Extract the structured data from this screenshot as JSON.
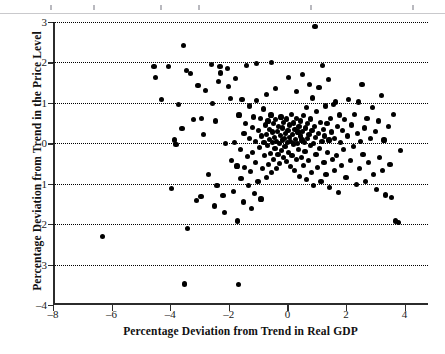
{
  "chart_data": {
    "type": "scatter",
    "title": "",
    "xlabel": "Percentage Deviation from Trend in Real GDP",
    "ylabel": "Percentage Deviation from Trend in the Price Level",
    "xlim": [
      -8,
      4.8
    ],
    "ylim": [
      -4,
      3
    ],
    "xticks": [
      -8,
      -6,
      -4,
      -2,
      0,
      2,
      4
    ],
    "xticklabels": [
      "–8",
      "–6",
      "–4",
      "–2",
      "0",
      "2",
      "4"
    ],
    "yticks": [
      -4,
      -3,
      -2,
      -1,
      0,
      1,
      2,
      3
    ],
    "yticklabels": [
      "–4",
      "–3",
      "–2",
      "–1",
      "0",
      "1",
      "2",
      "3"
    ],
    "gridlines_y": [
      -3,
      -2,
      -1,
      0,
      1,
      2,
      3
    ],
    "grid": "horizontal-dotted",
    "legend": "none",
    "marker": "filled-circle",
    "marker_color": "#000000",
    "n_points": 232,
    "points": [
      [
        -6.3,
        -2.3
      ],
      [
        -4.55,
        1.9
      ],
      [
        -4.5,
        1.63
      ],
      [
        -4.3,
        1.08
      ],
      [
        -4.05,
        1.9
      ],
      [
        -3.95,
        -1.12
      ],
      [
        -3.85,
        0.08
      ],
      [
        -3.8,
        -0.03
      ],
      [
        -3.6,
        0.37
      ],
      [
        -3.55,
        2.42
      ],
      [
        -3.5,
        -3.48
      ],
      [
        -3.45,
        1.8
      ],
      [
        -3.4,
        -2.1
      ],
      [
        -3.3,
        1.72
      ],
      [
        -3.2,
        0.58
      ],
      [
        -3.1,
        -1.42
      ],
      [
        -3.05,
        1.42
      ],
      [
        -2.95,
        -1.32
      ],
      [
        -2.85,
        0.22
      ],
      [
        -2.8,
        1.3
      ],
      [
        -2.7,
        -0.78
      ],
      [
        -2.6,
        1.95
      ],
      [
        -2.55,
        0.98
      ],
      [
        -2.5,
        -1.55
      ],
      [
        -2.45,
        0.55
      ],
      [
        -2.4,
        -1.05
      ],
      [
        -2.35,
        1.52
      ],
      [
        -2.3,
        1.9
      ],
      [
        -2.28,
        1.74
      ],
      [
        -2.2,
        -1.3
      ],
      [
        -2.15,
        -1.72
      ],
      [
        -2.1,
        0.0
      ],
      [
        -2.05,
        1.85
      ],
      [
        -2.0,
        1.4
      ],
      [
        -1.95,
        1.1
      ],
      [
        -1.9,
        -0.42
      ],
      [
        -1.85,
        -1.2
      ],
      [
        -1.8,
        0.02
      ],
      [
        -1.78,
        1.6
      ],
      [
        -1.72,
        -0.56
      ],
      [
        -1.7,
        -1.92
      ],
      [
        -1.68,
        -3.5
      ],
      [
        -1.65,
        0.7
      ],
      [
        -1.6,
        -0.15
      ],
      [
        -1.58,
        -0.88
      ],
      [
        -1.55,
        1.08
      ],
      [
        -1.5,
        -1.45
      ],
      [
        -1.48,
        0.25
      ],
      [
        -1.45,
        -0.6
      ],
      [
        -1.42,
        0.48
      ],
      [
        -1.4,
        1.92
      ],
      [
        -1.35,
        -0.32
      ],
      [
        -1.32,
        -1.05
      ],
      [
        -1.3,
        0.12
      ],
      [
        -1.28,
        0.92
      ],
      [
        -1.25,
        -0.7
      ],
      [
        -1.22,
        -1.62
      ],
      [
        -1.2,
        0.4
      ],
      [
        -1.18,
        -0.22
      ],
      [
        -1.15,
        0.65
      ],
      [
        -1.12,
        -1.25
      ],
      [
        -1.1,
        0.05
      ],
      [
        -1.08,
        -0.48
      ],
      [
        -1.05,
        1.05
      ],
      [
        -1.0,
        -0.95
      ],
      [
        -0.98,
        0.32
      ],
      [
        -0.95,
        -0.1
      ],
      [
        -0.92,
        0.62
      ],
      [
        -0.9,
        -1.38
      ],
      [
        -0.88,
        0.18
      ],
      [
        -0.85,
        -0.62
      ],
      [
        -0.82,
        0.85
      ],
      [
        -0.8,
        0.02
      ],
      [
        -0.78,
        -0.3
      ],
      [
        -0.75,
        0.45
      ],
      [
        -0.72,
        -0.85
      ],
      [
        -0.7,
        0.22
      ],
      [
        -0.68,
        -0.05
      ],
      [
        -0.66,
        0.55
      ],
      [
        -0.64,
        -0.52
      ],
      [
        -0.62,
        0.1
      ],
      [
        -0.6,
        0.35
      ],
      [
        -0.58,
        -0.25
      ],
      [
        -0.56,
        0.7
      ],
      [
        -0.54,
        -0.72
      ],
      [
        -0.52,
        0.02
      ],
      [
        -0.5,
        0.28
      ],
      [
        -0.48,
        -0.4
      ],
      [
        -0.46,
        0.48
      ],
      [
        -0.44,
        0.15
      ],
      [
        -0.42,
        -0.12
      ],
      [
        -0.4,
        0.58
      ],
      [
        -0.38,
        -0.62
      ],
      [
        -0.36,
        0.05
      ],
      [
        -0.34,
        0.3
      ],
      [
        -0.32,
        -0.28
      ],
      [
        -0.3,
        0.42
      ],
      [
        -0.28,
        0.0
      ],
      [
        -0.26,
        -0.5
      ],
      [
        -0.24,
        0.2
      ],
      [
        -0.22,
        0.65
      ],
      [
        -0.2,
        -0.18
      ],
      [
        -0.18,
        0.08
      ],
      [
        -0.16,
        0.38
      ],
      [
        -0.14,
        -0.35
      ],
      [
        -0.12,
        0.52
      ],
      [
        -0.1,
        0.12
      ],
      [
        -0.08,
        -0.08
      ],
      [
        -0.06,
        0.25
      ],
      [
        -0.04,
        -0.45
      ],
      [
        -0.02,
        0.6
      ],
      [
        0.0,
        0.02
      ],
      [
        0.02,
        0.32
      ],
      [
        0.04,
        -0.22
      ],
      [
        0.06,
        0.45
      ],
      [
        0.08,
        0.15
      ],
      [
        0.1,
        -0.58
      ],
      [
        0.12,
        0.05
      ],
      [
        0.14,
        0.72
      ],
      [
        0.16,
        -0.3
      ],
      [
        0.18,
        0.22
      ],
      [
        0.2,
        0.5
      ],
      [
        0.22,
        -0.02
      ],
      [
        0.24,
        -0.68
      ],
      [
        0.26,
        0.35
      ],
      [
        0.28,
        0.1
      ],
      [
        0.3,
        -0.4
      ],
      [
        0.32,
        0.62
      ],
      [
        0.34,
        0.0
      ],
      [
        0.36,
        0.28
      ],
      [
        0.38,
        -0.15
      ],
      [
        0.4,
        0.42
      ],
      [
        0.42,
        -0.82
      ],
      [
        0.44,
        0.18
      ],
      [
        0.46,
        0.55
      ],
      [
        0.48,
        -0.35
      ],
      [
        0.5,
        0.08
      ],
      [
        0.52,
        0.3
      ],
      [
        0.54,
        -0.55
      ],
      [
        0.56,
        0.68
      ],
      [
        0.58,
        0.02
      ],
      [
        0.6,
        -0.2
      ],
      [
        0.62,
        0.38
      ],
      [
        0.64,
        0.88
      ],
      [
        0.66,
        -0.9
      ],
      [
        0.68,
        0.12
      ],
      [
        0.7,
        0.48
      ],
      [
        0.72,
        -0.42
      ],
      [
        0.74,
        0.22
      ],
      [
        0.76,
        1.45
      ],
      [
        0.78,
        -0.05
      ],
      [
        0.8,
        0.6
      ],
      [
        0.82,
        -0.72
      ],
      [
        0.84,
        0.32
      ],
      [
        0.86,
        1.12
      ],
      [
        0.88,
        0.0
      ],
      [
        0.9,
        -1.05
      ],
      [
        0.92,
        0.42
      ],
      [
        0.94,
        2.88
      ],
      [
        0.96,
        0.15
      ],
      [
        0.98,
        -0.28
      ],
      [
        1.0,
        0.78
      ],
      [
        1.02,
        -0.6
      ],
      [
        1.05,
        0.25
      ],
      [
        1.08,
        1.38
      ],
      [
        1.1,
        -0.12
      ],
      [
        1.12,
        0.52
      ],
      [
        1.15,
        -0.95
      ],
      [
        1.18,
        0.05
      ],
      [
        1.2,
        1.92
      ],
      [
        1.22,
        0.35
      ],
      [
        1.25,
        -0.48
      ],
      [
        1.28,
        0.18
      ],
      [
        1.3,
        0.92
      ],
      [
        1.32,
        -0.78
      ],
      [
        1.35,
        0.48
      ],
      [
        1.38,
        -0.22
      ],
      [
        1.4,
        1.58
      ],
      [
        1.42,
        0.08
      ],
      [
        1.45,
        -1.1
      ],
      [
        1.48,
        0.62
      ],
      [
        1.5,
        0.28
      ],
      [
        1.55,
        -0.4
      ],
      [
        1.58,
        0.95
      ],
      [
        1.6,
        -0.68
      ],
      [
        1.62,
        0.12
      ],
      [
        1.65,
        1.02
      ],
      [
        1.68,
        -0.3
      ],
      [
        1.7,
        0.42
      ],
      [
        1.75,
        -1.22
      ],
      [
        1.78,
        0.7
      ],
      [
        1.8,
        0.02
      ],
      [
        1.85,
        -0.55
      ],
      [
        1.88,
        0.32
      ],
      [
        1.92,
        -0.15
      ],
      [
        1.95,
        0.58
      ],
      [
        2.0,
        -0.85
      ],
      [
        2.05,
        0.18
      ],
      [
        2.1,
        1.08
      ],
      [
        2.15,
        -0.42
      ],
      [
        2.2,
        0.45
      ],
      [
        2.25,
        -0.08
      ],
      [
        2.3,
        0.72
      ],
      [
        2.35,
        -1.02
      ],
      [
        2.4,
        0.25
      ],
      [
        2.45,
        -0.62
      ],
      [
        2.5,
        0.05
      ],
      [
        2.55,
        1.45
      ],
      [
        2.58,
        -0.28
      ],
      [
        2.62,
        0.38
      ],
      [
        2.68,
        -0.95
      ],
      [
        2.72,
        0.62
      ],
      [
        2.78,
        -0.48
      ],
      [
        2.85,
        0.12
      ],
      [
        2.9,
        0.88
      ],
      [
        2.95,
        -0.78
      ],
      [
        3.0,
        0.3
      ],
      [
        3.05,
        -1.15
      ],
      [
        3.1,
        0.55
      ],
      [
        3.15,
        -0.35
      ],
      [
        3.2,
        1.18
      ],
      [
        3.25,
        -0.68
      ],
      [
        3.3,
        0.08
      ],
      [
        3.35,
        -1.28
      ],
      [
        3.45,
        0.42
      ],
      [
        3.5,
        -0.52
      ],
      [
        3.55,
        -1.35
      ],
      [
        3.62,
        0.72
      ],
      [
        3.7,
        -1.92
      ],
      [
        3.78,
        -1.95
      ],
      [
        3.85,
        -0.18
      ],
      [
        -0.55,
        2.0
      ],
      [
        -1.05,
        1.98
      ],
      [
        0.05,
        1.62
      ],
      [
        -0.4,
        1.35
      ],
      [
        0.3,
        1.28
      ],
      [
        -0.72,
        1.2
      ],
      [
        0.52,
        1.7
      ],
      [
        -2.92,
        0.62
      ],
      [
        -3.72,
        0.95
      ],
      [
        2.42,
        1.02
      ]
    ]
  },
  "axes": {
    "x_label_text": "Percentage Deviation from Trend in Real GDP",
    "y_label_text": "Percentage Deviation from Trend in the Price Level"
  }
}
